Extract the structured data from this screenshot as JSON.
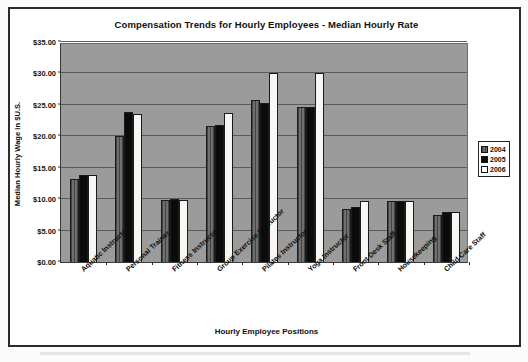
{
  "figure": {
    "title": "Compensation Trends for Hourly Employees - Median Hourly Rate",
    "xlabel": "Hourly Employee Positions",
    "ylabel": "Median Hourly Wage in $U.S."
  },
  "legend": {
    "position": "right",
    "entries": [
      {
        "label": "2004",
        "swatch": "gray-hatched",
        "color": "#6f6f6f"
      },
      {
        "label": "2005",
        "swatch": "solid-black",
        "color": "#0b0b0b"
      },
      {
        "label": "2006",
        "swatch": "white",
        "color": "#ffffff"
      }
    ]
  },
  "chart_data": {
    "type": "bar",
    "title": "Compensation Trends for Hourly Employees - Median Hourly Rate",
    "xlabel": "Hourly Employee Positions",
    "ylabel": "Median Hourly Wage in $U.S.",
    "ylim": [
      0,
      35
    ],
    "ytick_step": 5,
    "ytick_labels": [
      "$0.00",
      "$5.00",
      "$10.00",
      "$15.00",
      "$20.00",
      "$25.00",
      "$30.00",
      "$35.00"
    ],
    "ytick_values": [
      0,
      5,
      10,
      15,
      20,
      25,
      30,
      35
    ],
    "grid": true,
    "legend_position": "right",
    "categories": [
      "Aquatic Instructor",
      "Personal Trainer",
      "Fitness Instructor",
      "Group Exercise Instructor",
      "Pilates Instructor",
      "Yoga Instructor",
      "Front Desk Staff",
      "Housekeeping",
      "Child Care Staff"
    ],
    "series": [
      {
        "name": "2004",
        "color": "#6f6f6f",
        "values": [
          13.2,
          20.0,
          9.9,
          21.6,
          25.7,
          24.7,
          8.5,
          9.7,
          7.5
        ]
      },
      {
        "name": "2005",
        "color": "#0b0b0b",
        "values": [
          13.8,
          23.9,
          10.0,
          21.8,
          25.3,
          24.7,
          8.7,
          9.7,
          8.0
        ]
      },
      {
        "name": "2006",
        "color": "#ffffff",
        "values": [
          13.8,
          23.6,
          9.9,
          23.7,
          30.0,
          30.0,
          9.7,
          9.7,
          8.0
        ]
      }
    ]
  }
}
